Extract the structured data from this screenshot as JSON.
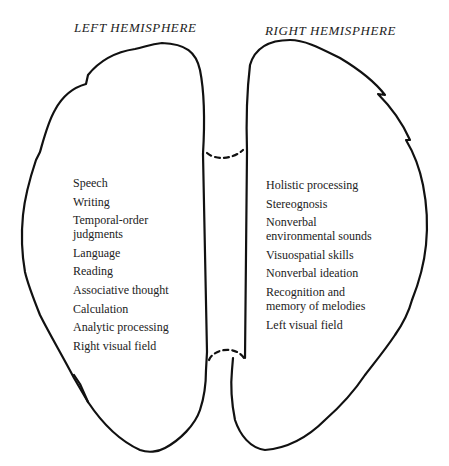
{
  "diagram": {
    "left_hemisphere": {
      "title": "LEFT HEMISPHERE",
      "functions": [
        "Speech",
        "Writing",
        "Temporal-order judgments",
        "Language",
        "Reading",
        "Associative thought",
        "Calculation",
        "Analytic processing",
        "Right visual field"
      ],
      "functions_display": [
        [
          "Speech"
        ],
        [
          "Writing"
        ],
        [
          "Temporal-order",
          "judgments"
        ],
        [
          "Language"
        ],
        [
          "Reading"
        ],
        [
          "Associative thought"
        ],
        [
          "Calculation"
        ],
        [
          "Analytic processing"
        ],
        [
          "Right visual field"
        ]
      ]
    },
    "right_hemisphere": {
      "title": "RIGHT HEMISPHERE",
      "functions": [
        "Holistic processing",
        "Stereognosis",
        "Nonverbal environmental sounds",
        "Visuospatial skills",
        "Nonverbal ideation",
        "Recognition and memory of melodies",
        "Left visual field"
      ],
      "functions_display": [
        [
          "Holistic processing"
        ],
        [
          "Stereognosis"
        ],
        [
          "Nonverbal",
          "environmental sounds"
        ],
        [
          "Visuospatial skills"
        ],
        [
          "Nonverbal ideation"
        ],
        [
          "Recognition and",
          "memory of melodies"
        ],
        [
          "Left visual field"
        ]
      ]
    },
    "colors": {
      "stroke": "#111111",
      "text": "#222222",
      "background": "#ffffff"
    }
  }
}
